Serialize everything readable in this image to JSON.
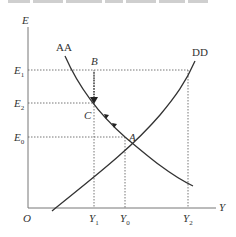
{
  "header": {
    "cropped_text": ""
  },
  "diagram": {
    "axes": {
      "y_label": "E",
      "x_label": "Y",
      "origin_label": "O"
    },
    "y_ticks": [
      {
        "label": "E",
        "sub": "1",
        "y": 70
      },
      {
        "label": "E",
        "sub": "2",
        "y": 103
      },
      {
        "label": "E",
        "sub": "0",
        "y": 137
      }
    ],
    "x_ticks": [
      {
        "label": "Y",
        "sub": "1",
        "x": 94
      },
      {
        "label": "Y",
        "sub": "0",
        "x": 125
      },
      {
        "label": "Y",
        "sub": "2",
        "x": 188
      }
    ],
    "curves": [
      {
        "name": "AA",
        "label": "AA",
        "slope": "downward"
      },
      {
        "name": "DD",
        "label": "DD",
        "slope": "upward"
      }
    ],
    "points": [
      {
        "label": "A",
        "desc": "equilibrium at (Y0, E0)"
      },
      {
        "label": "B",
        "desc": "(Y1, E1)"
      },
      {
        "label": "C",
        "desc": "(Y1, E2) on AA"
      }
    ],
    "colors": {
      "line": "#333333",
      "guide": "#555555"
    }
  }
}
